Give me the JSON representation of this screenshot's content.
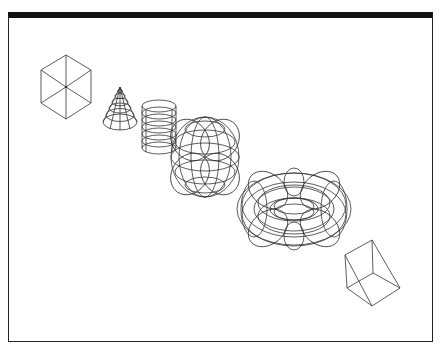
{
  "viewport": {
    "title_bar_color": "#111111",
    "frame_border_color": "#222222",
    "background": "#ffffff",
    "line_color": "#333333"
  },
  "scene": {
    "description": "Isometric wireframe primitives arranged diagonally",
    "objects": [
      {
        "id": "box",
        "type": "cube",
        "label": "Box"
      },
      {
        "id": "cone",
        "type": "cone",
        "label": "Cone"
      },
      {
        "id": "cylinder",
        "type": "cylinder",
        "label": "Cylinder"
      },
      {
        "id": "sphere",
        "type": "sphere",
        "label": "Sphere"
      },
      {
        "id": "torus",
        "type": "torus",
        "label": "Torus"
      },
      {
        "id": "wedge",
        "type": "wedge",
        "label": "Wedge"
      }
    ]
  }
}
